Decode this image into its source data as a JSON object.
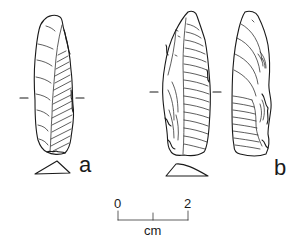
{
  "figure": {
    "artifacts": [
      {
        "id": "a",
        "label": "a",
        "views": [
          "dorsal"
        ],
        "has_cross_section": true,
        "section_marker": "horizontal tick marks at mid-length"
      },
      {
        "id": "b",
        "label": "b",
        "views": [
          "dorsal",
          "ventral"
        ],
        "has_cross_section": true,
        "section_marker": "horizontal tick marks at mid-length"
      }
    ],
    "scale_bar": {
      "start_label": "0",
      "end_label": "2",
      "unit_label": "cm",
      "ticks": 3
    },
    "colors": {
      "ink": "#1a1a1a",
      "background": "#ffffff"
    }
  }
}
